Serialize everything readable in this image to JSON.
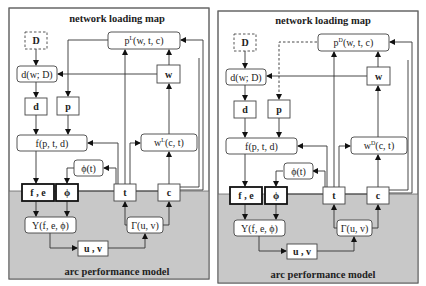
{
  "panels": [
    {
      "id": "left",
      "title": "network loading map",
      "footer": "arc performance model",
      "labels": {
        "D": "D",
        "d_of_w": "d(w; D)",
        "d": "d",
        "p": "p",
        "f_of": "f(p, t, d)",
        "p_top_base": "p",
        "p_top_sup": "L",
        "p_top_args": "(w, t, c)",
        "w": "w",
        "w_func_base": "w",
        "w_func_sup": "L",
        "w_func_args": "(c, t)",
        "phi_t": "ϕ(t)",
        "fe": "f , e",
        "phi": "ϕ",
        "t": "t",
        "c": "c",
        "upsilon": "Υ(f, e, ϕ)",
        "gamma": "Γ(u, v)",
        "uv": "u , v"
      },
      "p_link_style": "solid"
    },
    {
      "id": "right",
      "title": "network loading map",
      "footer": "arc performance model",
      "labels": {
        "D": "D",
        "d_of_w": "d(w; D)",
        "d": "d",
        "p": "p",
        "f_of": "f(p, t, d)",
        "p_top_base": "p",
        "p_top_sup": "D",
        "p_top_args": "(w, t, c)",
        "w": "w",
        "w_func_base": "w",
        "w_func_sup": "D",
        "w_func_args": "(c, t)",
        "phi_t": "ϕ(t)",
        "fe": "f , e",
        "phi": "ϕ",
        "t": "t",
        "c": "c",
        "upsilon": "Υ(f, e, ϕ)",
        "gamma": "Γ(u, v)",
        "uv": "u , v"
      },
      "p_link_style": "dashed"
    }
  ],
  "colors": {
    "panel_border": "#666666",
    "gray_area": "#c8c8c8",
    "box_fill": "#ffffff",
    "line": "#333333"
  }
}
